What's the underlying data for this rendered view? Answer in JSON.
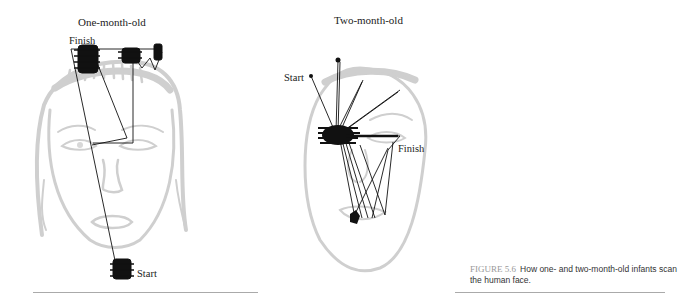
{
  "figure": {
    "panels": [
      {
        "title": "One-month-old",
        "start_label": "Start",
        "finish_label": "Finish"
      },
      {
        "title": "Two-month-old",
        "start_label": "Start",
        "finish_label": "Finish"
      }
    ],
    "caption": {
      "number": "FIGURE 5.6",
      "text": "How one- and two-month-old infants scan the human face."
    },
    "colors": {
      "face_outline": "#c8c8c8",
      "scan_path": "#111111",
      "caption_number": "#999999"
    }
  }
}
